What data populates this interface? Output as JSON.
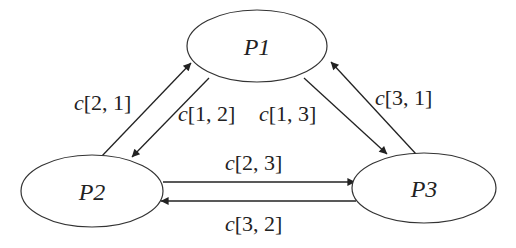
{
  "diagram": {
    "nodes": [
      {
        "id": "P1",
        "label": "P1"
      },
      {
        "id": "P2",
        "label": "P2"
      },
      {
        "id": "P3",
        "label": "P3"
      }
    ],
    "edges": [
      {
        "from": "P2",
        "to": "P1",
        "var": "c",
        "index": "[2, 1]"
      },
      {
        "from": "P1",
        "to": "P2",
        "var": "c",
        "index": "[1, 2]"
      },
      {
        "from": "P1",
        "to": "P3",
        "var": "c",
        "index": "[1, 3]"
      },
      {
        "from": "P3",
        "to": "P1",
        "var": "c",
        "index": "[3, 1]"
      },
      {
        "from": "P2",
        "to": "P3",
        "var": "c",
        "index": "[2, 3]"
      },
      {
        "from": "P3",
        "to": "P2",
        "var": "c",
        "index": "[3, 2]"
      }
    ],
    "colors": {
      "stroke": "#222222",
      "background": "#ffffff"
    }
  }
}
